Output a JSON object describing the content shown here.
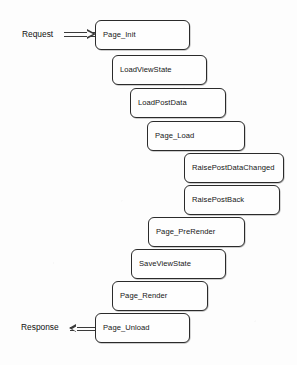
{
  "diagram": {
    "type": "flow-staircase",
    "background_color": "#fdfdfd",
    "node_border_color": "#2b2b2b",
    "text_color": "#161616",
    "nodes": [
      {
        "id": "page-init",
        "label": "Page_Init",
        "x": 95,
        "y": 20,
        "w": 95,
        "h": 30
      },
      {
        "id": "load-view-state",
        "label": "LoadViewState",
        "x": 112,
        "y": 55,
        "w": 95,
        "h": 30
      },
      {
        "id": "load-post-data",
        "label": "LoadPostData",
        "x": 130,
        "y": 88,
        "w": 96,
        "h": 30
      },
      {
        "id": "page-load",
        "label": "Page_Load",
        "x": 147,
        "y": 121,
        "w": 98,
        "h": 30
      },
      {
        "id": "raise-post-data-changed",
        "label": "RaisePostDataChanged",
        "x": 184,
        "y": 153,
        "w": 100,
        "h": 30
      },
      {
        "id": "raise-post-back",
        "label": "RaisePostBack",
        "x": 184,
        "y": 185,
        "w": 96,
        "h": 30
      },
      {
        "id": "page-prerender",
        "label": "Page_PreRender",
        "x": 148,
        "y": 217,
        "w": 97,
        "h": 30
      },
      {
        "id": "save-view-state",
        "label": "SaveViewState",
        "x": 131,
        "y": 249,
        "w": 95,
        "h": 30
      },
      {
        "id": "page-render",
        "label": "Page_Render",
        "x": 112,
        "y": 281,
        "w": 96,
        "h": 30
      },
      {
        "id": "page-unload",
        "label": "Page_Unload",
        "x": 95,
        "y": 313,
        "w": 95,
        "h": 30
      }
    ],
    "edges": [
      {
        "id": "request",
        "label": "Request",
        "direction": "right",
        "label_x": 22,
        "label_y": 30,
        "arrow_x": 64,
        "arrow_y": 35,
        "arrow_len": 31
      },
      {
        "id": "response",
        "label": "Response",
        "direction": "left",
        "label_x": 21,
        "label_y": 323,
        "arrow_x": 70,
        "arrow_y": 329,
        "arrow_len": 25
      }
    ]
  }
}
